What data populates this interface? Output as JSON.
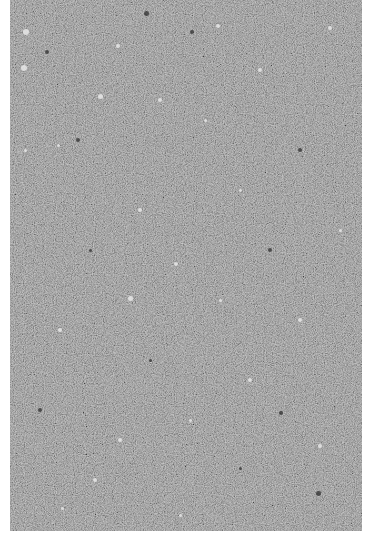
{
  "image": {
    "subject": "speckled gray stone texture",
    "colors": {
      "background": "#ffffff",
      "base_gray": "#8b8b8b",
      "light_speck": "#e8e8e8",
      "dark_speck": "#2e2e2e"
    },
    "texture_bounds": {
      "x": 10,
      "y": 0,
      "width": 352,
      "height": 531
    }
  },
  "specks": [
    {
      "x": 26,
      "y": 32,
      "r": 3,
      "tone": "light"
    },
    {
      "x": 146,
      "y": 13,
      "r": 2.5,
      "tone": "dark"
    },
    {
      "x": 24,
      "y": 68,
      "r": 3,
      "tone": "light"
    },
    {
      "x": 47,
      "y": 52,
      "r": 2,
      "tone": "dark"
    },
    {
      "x": 100,
      "y": 96,
      "r": 2.5,
      "tone": "light"
    },
    {
      "x": 78,
      "y": 140,
      "r": 2,
      "tone": "dark"
    },
    {
      "x": 118,
      "y": 46,
      "r": 2,
      "tone": "light"
    },
    {
      "x": 218,
      "y": 26,
      "r": 2,
      "tone": "light"
    },
    {
      "x": 192,
      "y": 32,
      "r": 2,
      "tone": "dark"
    },
    {
      "x": 160,
      "y": 100,
      "r": 2,
      "tone": "light"
    },
    {
      "x": 205,
      "y": 120,
      "r": 1.5,
      "tone": "light"
    },
    {
      "x": 58,
      "y": 145,
      "r": 1.5,
      "tone": "light"
    },
    {
      "x": 260,
      "y": 70,
      "r": 2,
      "tone": "light"
    },
    {
      "x": 330,
      "y": 28,
      "r": 2,
      "tone": "light"
    },
    {
      "x": 300,
      "y": 150,
      "r": 2,
      "tone": "dark"
    },
    {
      "x": 240,
      "y": 190,
      "r": 1.5,
      "tone": "light"
    },
    {
      "x": 140,
      "y": 210,
      "r": 2,
      "tone": "light"
    },
    {
      "x": 90,
      "y": 250,
      "r": 1.5,
      "tone": "dark"
    },
    {
      "x": 176,
      "y": 264,
      "r": 2,
      "tone": "light"
    },
    {
      "x": 130,
      "y": 298,
      "r": 2.5,
      "tone": "light"
    },
    {
      "x": 220,
      "y": 300,
      "r": 1.5,
      "tone": "light"
    },
    {
      "x": 60,
      "y": 330,
      "r": 2,
      "tone": "light"
    },
    {
      "x": 300,
      "y": 320,
      "r": 2,
      "tone": "light"
    },
    {
      "x": 150,
      "y": 360,
      "r": 1.5,
      "tone": "dark"
    },
    {
      "x": 250,
      "y": 380,
      "r": 2,
      "tone": "light"
    },
    {
      "x": 40,
      "y": 410,
      "r": 2,
      "tone": "dark"
    },
    {
      "x": 190,
      "y": 420,
      "r": 1.5,
      "tone": "light"
    },
    {
      "x": 120,
      "y": 440,
      "r": 2,
      "tone": "light"
    },
    {
      "x": 320,
      "y": 446,
      "r": 2,
      "tone": "light"
    },
    {
      "x": 240,
      "y": 468,
      "r": 1.5,
      "tone": "dark"
    },
    {
      "x": 95,
      "y": 480,
      "r": 2,
      "tone": "light"
    },
    {
      "x": 318,
      "y": 493,
      "r": 2.5,
      "tone": "dark"
    },
    {
      "x": 62,
      "y": 508,
      "r": 1.5,
      "tone": "light"
    },
    {
      "x": 180,
      "y": 515,
      "r": 1.5,
      "tone": "light"
    },
    {
      "x": 281,
      "y": 413,
      "r": 2,
      "tone": "dark"
    },
    {
      "x": 25,
      "y": 150,
      "r": 1.5,
      "tone": "light"
    },
    {
      "x": 340,
      "y": 230,
      "r": 1.5,
      "tone": "light"
    },
    {
      "x": 270,
      "y": 250,
      "r": 2,
      "tone": "dark"
    }
  ]
}
